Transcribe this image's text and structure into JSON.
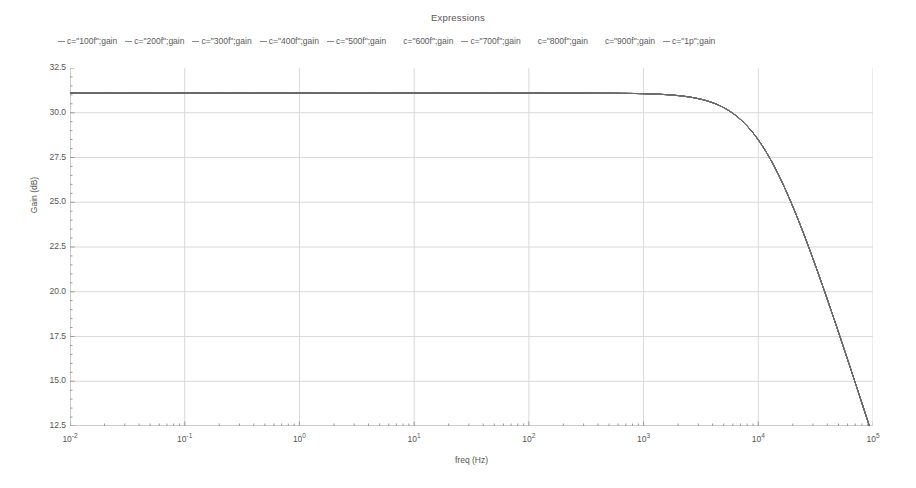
{
  "chart_title": "Expressions",
  "legend": {
    "entries": [
      {
        "label": "c=\"100f\";gain",
        "marker": "dash"
      },
      {
        "label": "c=\"200f\";gain",
        "marker": "dash"
      },
      {
        "label": "c=\"300f\";gain",
        "marker": "dash"
      },
      {
        "label": "c=\"400f\";gain",
        "marker": "dash"
      },
      {
        "label": "c=\"500f\";gain",
        "marker": "dash"
      },
      {
        "label": "c=\"600f\";gain",
        "marker": "blank"
      },
      {
        "label": "c=\"700f\";gain",
        "marker": "dash"
      },
      {
        "label": "c=\"800f\";gain",
        "marker": "blank"
      },
      {
        "label": "c=\"900f\";gain",
        "marker": "blank"
      },
      {
        "label": "c=\"1p\";gain",
        "marker": "dash"
      }
    ]
  },
  "axes": {
    "ylabel": "Gain (dB)",
    "xlabel": "freq (Hz)",
    "yticks": [
      "32.5",
      "30.0",
      "27.5",
      "25.0",
      "22.5",
      "20.0",
      "17.5",
      "15.0",
      "12.5"
    ],
    "ytick_values": [
      32.5,
      30.0,
      27.5,
      25.0,
      22.5,
      20.0,
      17.5,
      15.0,
      12.5
    ],
    "xticks": [
      {
        "mantissa": "10",
        "exponent": "-2"
      },
      {
        "mantissa": "10",
        "exponent": "-1"
      },
      {
        "mantissa": "10",
        "exponent": "0"
      },
      {
        "mantissa": "10",
        "exponent": "1"
      },
      {
        "mantissa": "10",
        "exponent": "2"
      },
      {
        "mantissa": "10",
        "exponent": "3"
      },
      {
        "mantissa": "10",
        "exponent": "4"
      },
      {
        "mantissa": "10",
        "exponent": "5"
      }
    ]
  },
  "colors": {
    "curve": "#6b6b6b",
    "grid": "#d9d9d9",
    "frame": "#9a9a9a",
    "text": "#555555"
  },
  "chart_data": {
    "type": "line",
    "title": "Expressions",
    "xlabel": "freq (Hz)",
    "ylabel": "Gain (dB)",
    "xscale": "log",
    "xlim": [
      0.01,
      100000
    ],
    "ylim": [
      12.5,
      32.5
    ],
    "grid": true,
    "legend_position": "top",
    "series": [
      {
        "name": "c=\"100f\";gain",
        "x": [
          0.01,
          0.1,
          1,
          10,
          100,
          1000,
          2000,
          4000,
          6000,
          8000,
          10000,
          14000,
          20000,
          30000,
          50000,
          70000,
          100000
        ],
        "y": [
          31.1,
          31.1,
          31.1,
          31.1,
          31.1,
          31.05,
          31.0,
          30.8,
          30.4,
          29.9,
          29.4,
          27.9,
          25.8,
          22.9,
          18.8,
          16.1,
          13.3
        ]
      },
      {
        "name": "c=\"200f\";gain",
        "x": [
          0.01,
          0.1,
          1,
          10,
          100,
          1000,
          2000,
          4000,
          6000,
          8000,
          10000,
          14000,
          20000,
          30000,
          50000,
          70000,
          100000
        ],
        "y": [
          31.1,
          31.1,
          31.1,
          31.1,
          31.1,
          31.05,
          31.0,
          30.8,
          30.4,
          29.9,
          29.4,
          27.9,
          25.8,
          22.9,
          18.8,
          16.1,
          13.3
        ]
      },
      {
        "name": "c=\"300f\";gain",
        "x": [
          0.01,
          0.1,
          1,
          10,
          100,
          1000,
          2000,
          4000,
          6000,
          8000,
          10000,
          14000,
          20000,
          30000,
          50000,
          70000,
          100000
        ],
        "y": [
          31.1,
          31.1,
          31.1,
          31.1,
          31.1,
          31.05,
          31.0,
          30.8,
          30.4,
          29.9,
          29.4,
          27.9,
          25.8,
          22.9,
          18.8,
          16.1,
          13.3
        ]
      },
      {
        "name": "c=\"400f\";gain",
        "x": [
          0.01,
          0.1,
          1,
          10,
          100,
          1000,
          2000,
          4000,
          6000,
          8000,
          10000,
          14000,
          20000,
          30000,
          50000,
          70000,
          100000
        ],
        "y": [
          31.1,
          31.1,
          31.1,
          31.1,
          31.1,
          31.05,
          31.0,
          30.8,
          30.4,
          29.9,
          29.4,
          27.9,
          25.8,
          22.9,
          18.8,
          16.1,
          13.3
        ]
      },
      {
        "name": "c=\"500f\";gain",
        "x": [
          0.01,
          0.1,
          1,
          10,
          100,
          1000,
          2000,
          4000,
          6000,
          8000,
          10000,
          14000,
          20000,
          30000,
          50000,
          70000,
          100000
        ],
        "y": [
          31.1,
          31.1,
          31.1,
          31.1,
          31.1,
          31.05,
          31.0,
          30.8,
          30.4,
          29.9,
          29.4,
          27.9,
          25.8,
          22.9,
          18.8,
          16.1,
          13.3
        ]
      },
      {
        "name": "c=\"600f\";gain",
        "x": [
          0.01,
          0.1,
          1,
          10,
          100,
          1000,
          2000,
          4000,
          6000,
          8000,
          10000,
          14000,
          20000,
          30000,
          50000,
          70000,
          100000
        ],
        "y": [
          31.1,
          31.1,
          31.1,
          31.1,
          31.1,
          31.05,
          31.0,
          30.8,
          30.4,
          29.9,
          29.4,
          27.9,
          25.8,
          22.9,
          18.8,
          16.1,
          13.3
        ]
      },
      {
        "name": "c=\"700f\";gain",
        "x": [
          0.01,
          0.1,
          1,
          10,
          100,
          1000,
          2000,
          4000,
          6000,
          8000,
          10000,
          14000,
          20000,
          30000,
          50000,
          70000,
          100000
        ],
        "y": [
          31.1,
          31.1,
          31.1,
          31.1,
          31.1,
          31.05,
          31.0,
          30.8,
          30.4,
          29.9,
          29.4,
          27.9,
          25.8,
          22.9,
          18.8,
          16.1,
          13.3
        ]
      },
      {
        "name": "c=\"800f\";gain",
        "x": [
          0.01,
          0.1,
          1,
          10,
          100,
          1000,
          2000,
          4000,
          6000,
          8000,
          10000,
          14000,
          20000,
          30000,
          50000,
          70000,
          100000
        ],
        "y": [
          31.1,
          31.1,
          31.1,
          31.1,
          31.1,
          31.05,
          31.0,
          30.8,
          30.4,
          29.9,
          29.4,
          27.9,
          25.8,
          22.9,
          18.8,
          16.1,
          13.3
        ]
      },
      {
        "name": "c=\"900f\";gain",
        "x": [
          0.01,
          0.1,
          1,
          10,
          100,
          1000,
          2000,
          4000,
          6000,
          8000,
          10000,
          14000,
          20000,
          30000,
          50000,
          70000,
          100000
        ],
        "y": [
          31.1,
          31.1,
          31.1,
          31.1,
          31.1,
          31.05,
          31.0,
          30.8,
          30.4,
          29.9,
          29.4,
          27.9,
          25.8,
          22.9,
          18.8,
          16.1,
          13.3
        ]
      },
      {
        "name": "c=\"1p\";gain",
        "x": [
          0.01,
          0.1,
          1,
          10,
          100,
          1000,
          2000,
          4000,
          6000,
          8000,
          10000,
          14000,
          20000,
          30000,
          50000,
          70000,
          100000
        ],
        "y": [
          31.1,
          31.1,
          31.1,
          31.1,
          31.1,
          31.05,
          31.0,
          30.8,
          30.4,
          29.9,
          29.4,
          27.9,
          25.8,
          22.9,
          18.8,
          16.1,
          13.3
        ]
      }
    ],
    "passband_gain_db": 31.1,
    "corner_frequency_hz": 11000,
    "final_gain_db": 13.3
  }
}
